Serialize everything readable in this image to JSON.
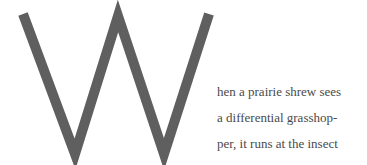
{
  "drop_cap": {
    "letter": "W",
    "color": "#5f5f5f"
  },
  "paragraph": {
    "lines": [
      "hen a prairie shrew sees",
      "a differential grasshop-",
      "per, it runs at the insect"
    ]
  }
}
